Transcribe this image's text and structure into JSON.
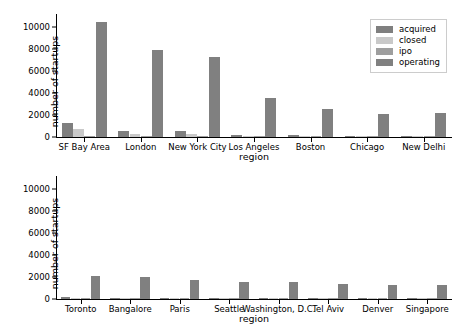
{
  "figure": {
    "background": "#ffffff",
    "width": 459,
    "height": 324
  },
  "palette": {
    "acquired": "#7f7f7f",
    "closed": "#c9c9c9",
    "ipo": "#9e9e9e",
    "operating": "#808080",
    "axis": "#000000"
  },
  "legend": {
    "entries": [
      {
        "label": "acquired",
        "color": "#7f7f7f"
      },
      {
        "label": "closed",
        "color": "#c9c9c9"
      },
      {
        "label": "ipo",
        "color": "#9e9e9e"
      },
      {
        "label": "operating",
        "color": "#808080"
      }
    ]
  },
  "chart_data": [
    {
      "type": "bar",
      "title": "",
      "xlabel": "region",
      "ylabel": "number of startups",
      "ylim": [
        0,
        11000
      ],
      "yticks": [
        0,
        2000,
        4000,
        6000,
        8000,
        10000
      ],
      "ytick_labels": [
        "0",
        "2000",
        "4000",
        "6000",
        "8000",
        "10000"
      ],
      "grid": false,
      "legend_position": "upper right",
      "grouped": true,
      "categories": [
        "SF Bay Area",
        "London",
        "New York City",
        "Los Angeles",
        "Boston",
        "Chicago",
        "New Delhi"
      ],
      "series": [
        {
          "name": "acquired",
          "color": "#7f7f7f",
          "values": [
            1300,
            560,
            520,
            170,
            140,
            60,
            20
          ]
        },
        {
          "name": "closed",
          "color": "#c9c9c9",
          "values": [
            760,
            280,
            310,
            80,
            40,
            25,
            10
          ]
        },
        {
          "name": "ipo",
          "color": "#9e9e9e",
          "values": [
            60,
            45,
            30,
            10,
            15,
            5,
            5
          ]
        },
        {
          "name": "operating",
          "color": "#808080",
          "values": [
            10450,
            7950,
            7300,
            3520,
            2540,
            2090,
            2150
          ]
        }
      ]
    },
    {
      "type": "bar",
      "title": "",
      "xlabel": "region",
      "ylabel": "number of startups",
      "ylim": [
        0,
        11000
      ],
      "yticks": [
        0,
        2000,
        4000,
        6000,
        8000,
        10000
      ],
      "ytick_labels": [
        "0",
        "2000",
        "4000",
        "6000",
        "8000",
        "10000"
      ],
      "grid": false,
      "legend_position": "upper right",
      "grouped": true,
      "categories": [
        "Toronto",
        "Bangalore",
        "Paris",
        "Seattle",
        "Washington, D.C.",
        "Tel Aviv",
        "Denver",
        "Singapore"
      ],
      "series": [
        {
          "name": "acquired",
          "color": "#7f7f7f",
          "values": [
            170,
            50,
            110,
            105,
            95,
            60,
            85,
            40
          ]
        },
        {
          "name": "closed",
          "color": "#c9c9c9",
          "values": [
            70,
            30,
            40,
            40,
            35,
            25,
            30,
            20
          ]
        },
        {
          "name": "ipo",
          "color": "#9e9e9e",
          "values": [
            25,
            15,
            20,
            15,
            15,
            10,
            10,
            10
          ]
        },
        {
          "name": "operating",
          "color": "#808080",
          "values": [
            2090,
            1990,
            1770,
            1570,
            1540,
            1370,
            1250,
            1280
          ]
        }
      ]
    }
  ]
}
